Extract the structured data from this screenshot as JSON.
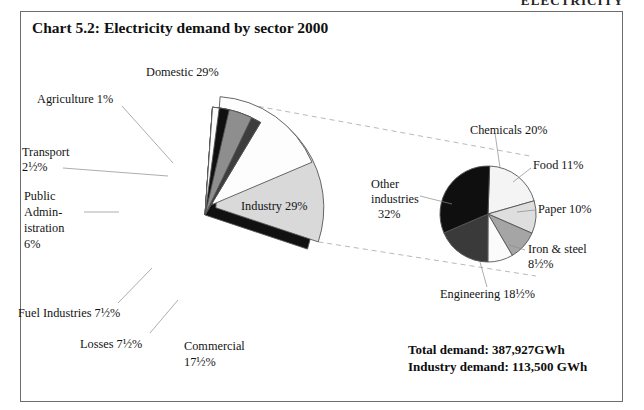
{
  "page": {
    "running_header": "ELECTRICITY"
  },
  "chart": {
    "title": "Chart 5.2:  Electricity demand by sector 2000",
    "totals": {
      "total_demand_label": "Total demand: 387,927GWh",
      "industry_demand_label": "Industry demand: 113,500 GWh"
    }
  },
  "chart_data": [
    {
      "type": "pie",
      "name": "electricity-demand-by-sector",
      "title": "Chart 5.2:  Electricity demand by sector 2000",
      "unit": "percent",
      "total_label": "Total demand: 387,927GWh",
      "total_value": 387927,
      "total_unit": "GWh",
      "legend_position": "none",
      "labels_mode": "callout-labels",
      "categories": [
        "Domestic",
        "Industry",
        "Commercial",
        "Losses",
        "Fuel Industries",
        "Public Administration",
        "Transport",
        "Agriculture"
      ],
      "values": [
        29,
        29,
        17.5,
        7.5,
        7.5,
        6,
        2.5,
        1
      ],
      "value_labels": [
        "29%",
        "29%",
        "17½%",
        "7½%",
        "7½%",
        "6%",
        "2½%",
        "1%"
      ],
      "slices": [
        {
          "label": "Domestic 29%",
          "name": "domestic",
          "value": 29,
          "display": "29%",
          "color": "#111111",
          "exploded": false
        },
        {
          "label": "Industry 29%",
          "name": "industry",
          "value": 29,
          "display": "29%",
          "color": "#d9d9d9",
          "exploded": true
        },
        {
          "label": "Commercial 17½%",
          "name": "commercial",
          "value": 17.5,
          "display": "17½%",
          "color": "#fdfdfd",
          "exploded": true
        },
        {
          "label": "Losses 7½%",
          "name": "losses",
          "value": 7.5,
          "display": "7½%",
          "color": "#b9b9b9",
          "exploded": false
        },
        {
          "label": "Fuel Industries 7½%",
          "name": "fuel-industries",
          "value": 7.5,
          "display": "7½%",
          "color": "#3d3d3d",
          "exploded": false
        },
        {
          "label": "Public Administration 6%",
          "name": "public-administration",
          "value": 6,
          "display": "6%",
          "color": "#8e8e8e",
          "exploded": false
        },
        {
          "label": "Transport 2½%",
          "name": "transport",
          "value": 2.5,
          "display": "2½%",
          "color": "#101010",
          "exploded": false
        },
        {
          "label": "Agriculture 1%",
          "name": "agriculture",
          "value": 1,
          "display": "1%",
          "color": "#fbfbfb",
          "exploded": false
        }
      ]
    },
    {
      "type": "pie",
      "name": "industry-demand-breakdown",
      "title": "Industry demand breakdown",
      "unit": "percent",
      "total_label": "Industry demand: 113,500 GWh",
      "total_value": 113500,
      "total_unit": "GWh",
      "legend_position": "none",
      "labels_mode": "callout-labels",
      "categories": [
        "Chemicals",
        "Food",
        "Paper",
        "Iron & steel",
        "Engineering",
        "Other industries"
      ],
      "values": [
        20,
        11,
        10,
        8.5,
        18.5,
        32
      ],
      "value_labels": [
        "20%",
        "11%",
        "10%",
        "8½%",
        "18½%",
        "32%"
      ],
      "slices": [
        {
          "label": "Chemicals 20%",
          "name": "chemicals",
          "value": 20,
          "display": "20%",
          "color": "#f4f4f4"
        },
        {
          "label": "Food 11%",
          "name": "food",
          "value": 11,
          "display": "11%",
          "color": "#dedede"
        },
        {
          "label": "Paper 10%",
          "name": "paper",
          "value": 10,
          "display": "10%",
          "color": "#a5a5a5"
        },
        {
          "label": "Iron & steel 8½%",
          "name": "iron-and-steel",
          "value": 8.5,
          "display": "8½%",
          "color": "#fbfbfb"
        },
        {
          "label": "Engineering 18½%",
          "name": "engineering",
          "value": 18.5,
          "display": "18½%",
          "color": "#3a3a3a"
        },
        {
          "label": "Other industries 32%",
          "name": "other-industries",
          "value": 32,
          "display": "32%",
          "color": "#0f0f0f"
        }
      ]
    }
  ],
  "labels": {
    "main": {
      "domestic": "Domestic 29%",
      "agriculture": "Agriculture 1%",
      "transport_l1": "Transport",
      "transport_l2": "2½%",
      "public_admin_l1": "Public",
      "public_admin_l2": "Admin-",
      "public_admin_l3": "istration",
      "public_admin_l4": "6%",
      "fuel_industries": "Fuel Industries 7½%",
      "losses": "Losses 7½%",
      "commercial_l1": "Commercial",
      "commercial_l2": "17½%",
      "industry": "Industry 29%"
    },
    "sub": {
      "chemicals": "Chemicals 20%",
      "food": "Food 11%",
      "paper": "Paper 10%",
      "iron_steel_l1": "Iron & steel",
      "iron_steel_l2": "8½%",
      "engineering": "Engineering 18½%",
      "other_l1": "Other",
      "other_l2": "industries",
      "other_l3": "32%"
    }
  },
  "colors": {
    "frame": "#6d6d6d",
    "stroke": "#555555",
    "connector": "#b0b0b0",
    "text": "#141414"
  }
}
